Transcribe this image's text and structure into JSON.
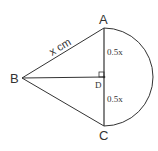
{
  "diagram": {
    "points": {
      "A": {
        "label": "A",
        "x": 104,
        "y": 28
      },
      "B": {
        "label": "B",
        "x": 22,
        "y": 78
      },
      "C": {
        "label": "C",
        "x": 104,
        "y": 126
      },
      "D": {
        "label": "D",
        "x": 104,
        "y": 77
      }
    },
    "labels": {
      "AB": "x cm",
      "AD": "0.5x",
      "DC": "0.5x"
    },
    "colors": {
      "stroke": "#333333",
      "background": "#ffffff"
    }
  }
}
